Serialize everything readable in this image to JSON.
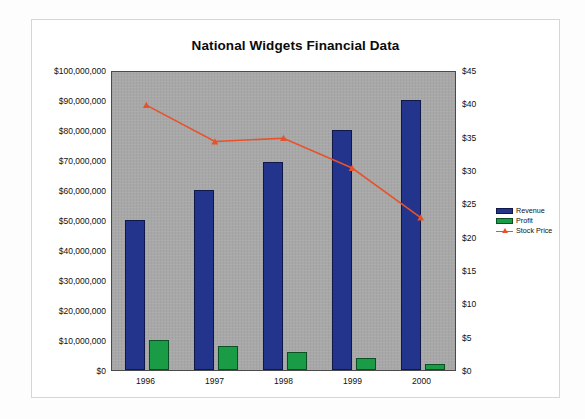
{
  "card": {
    "background": "#ffffff",
    "border_color": "#d6d6d6"
  },
  "chart_data": {
    "type": "bar",
    "title": "National Widgets Financial Data",
    "xlabel": "",
    "ylabel": "",
    "categories": [
      "1996",
      "1997",
      "1998",
      "1999",
      "2000"
    ],
    "grid": false,
    "legend_position": "right",
    "plot_background": "#a8a8a8",
    "series": [
      {
        "name": "Revenue",
        "type": "bar",
        "axis": "left",
        "color": "#22348c",
        "values": [
          50000000,
          60000000,
          69500000,
          80000000,
          90000000
        ]
      },
      {
        "name": "Profit",
        "type": "bar",
        "axis": "left",
        "color": "#1a9c46",
        "values": [
          10000000,
          8000000,
          6000000,
          4000000,
          2000000
        ]
      },
      {
        "name": "Stock Price",
        "type": "line",
        "axis": "right",
        "color": "#e8522b",
        "marker": "triangle",
        "values": [
          40,
          34.5,
          35,
          30.5,
          23
        ]
      }
    ],
    "y_left": {
      "min": 0,
      "max": 100000000,
      "step": 10000000,
      "ticks": [
        "$0",
        "$10,000,000",
        "$20,000,000",
        "$30,000,000",
        "$40,000,000",
        "$50,000,000",
        "$60,000,000",
        "$70,000,000",
        "$80,000,000",
        "$90,000,000",
        "$100,000,000"
      ]
    },
    "y_right": {
      "min": 0,
      "max": 45,
      "step": 5,
      "ticks": [
        "$0",
        "$5",
        "$10",
        "$15",
        "$20",
        "$25",
        "$30",
        "$35",
        "$40",
        "$45"
      ]
    }
  },
  "legend": {
    "items": [
      {
        "label": "Revenue",
        "color": "#22348c",
        "kind": "bar"
      },
      {
        "label": "Profit",
        "color": "#1a9c46",
        "kind": "bar"
      },
      {
        "label": "Stock Price",
        "color": "#e8522b",
        "kind": "line"
      }
    ]
  }
}
